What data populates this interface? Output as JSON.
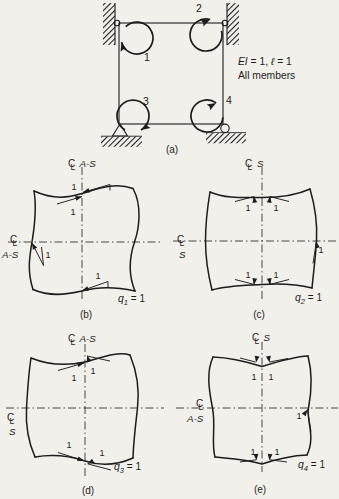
{
  "palette": {
    "paper": "#f2f0eb",
    "ink": "#1c1c1c"
  },
  "icons": {
    "centerline_symbol": "℄"
  },
  "figure_a": {
    "caption": "(a)",
    "note": {
      "ei": "EI",
      "mid": " = 1, ",
      "ell": "ℓ",
      "end": " = 1",
      "line2": "All members"
    },
    "moments": {
      "m1": "1",
      "m2": "2",
      "m3": "3",
      "m4": "4"
    }
  },
  "figure_b": {
    "caption": "(b)",
    "top_axis": "A-S",
    "left_axis": "A-S",
    "q": {
      "name": "q",
      "sub": "1",
      "eq": " = 1"
    },
    "slopes": {
      "s1": "1",
      "s2": "1",
      "s3": "1",
      "s4": "1"
    }
  },
  "figure_c": {
    "caption": "(c)",
    "top_axis": "S",
    "left_axis": "S",
    "q": {
      "name": "q",
      "sub": "2",
      "eq": " = 1"
    },
    "slopes": {
      "s1": "1",
      "s2": "1",
      "s3": "1",
      "s4": "1",
      "s5": "1"
    }
  },
  "figure_d": {
    "caption": "(d)",
    "top_axis": "A-S",
    "left_axis": "S",
    "q": {
      "name": "q",
      "sub": "3",
      "eq": " = 1"
    },
    "slopes": {
      "s1": "1",
      "s2": "1",
      "s3": "1",
      "s4": "1"
    }
  },
  "figure_e": {
    "caption": "(e)",
    "top_axis": "S",
    "left_axis": "A-S",
    "q": {
      "name": "q",
      "sub": "4",
      "eq": " = 1"
    },
    "slopes": {
      "s1": "1",
      "s2": "1",
      "s3": "1",
      "s4": "1",
      "s5": "1"
    }
  }
}
